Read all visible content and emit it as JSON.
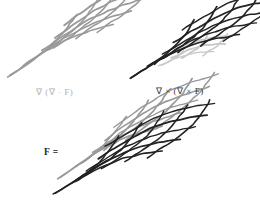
{
  "figure": {
    "background_color": "#ffffff",
    "width": 260,
    "height": 204,
    "colors": {
      "gray_mesh": "#999999",
      "dark_mesh": "#222222",
      "faint_mesh": "#c8c8c8",
      "label_gray": "#b3b3b3",
      "label_dark": "#3a3a3a",
      "label_black": "#1e1e1e"
    },
    "panels": [
      {
        "id": "grad-div",
        "label": "∇ (∇ · F)",
        "label_color": "#b3b3b3",
        "position": "top-left",
        "meshes": [
          "gray"
        ],
        "bounds": {
          "x": 15,
          "y": 12,
          "width": 112,
          "height": 68
        }
      },
      {
        "id": "curl-curl",
        "label": "∇ × (∇ × F)",
        "label_color": "#3a3a3a",
        "position": "top-right",
        "meshes": [
          "faint",
          "dark"
        ],
        "bounds": {
          "x": 134,
          "y": 24,
          "width": 122,
          "height": 62
        }
      },
      {
        "id": "f-total",
        "label": "F =",
        "label_color": "#1e1e1e",
        "position": "bottom-center",
        "meshes": [
          "gray",
          "dark"
        ],
        "bounds": {
          "x": 62,
          "y": 114,
          "width": 134,
          "height": 88
        }
      }
    ]
  },
  "chart_data": {
    "type": "diagram",
    "grid": true,
    "legend_position": "none",
    "xlabel": "",
    "ylabel": "",
    "annotations": [
      {
        "text": "∇ (∇ · F)",
        "x": 36,
        "y": 92,
        "color": "#b3b3b3"
      },
      {
        "text": "∇ × (∇ × F)",
        "x": 156,
        "y": 92,
        "color": "#3a3a3a"
      },
      {
        "text": "F =",
        "x": 44,
        "y": 153,
        "color": "#1e1e1e"
      }
    ],
    "series": [
      {
        "name": "grad-div-mesh",
        "color": "#999999",
        "panel": "top-left",
        "u_lines": 5,
        "v_lines": 5,
        "origin_x": 18,
        "origin_y": 70,
        "u_step_x": 22,
        "u_step_y": -11,
        "v_step_x": 14,
        "v_step_y": -13,
        "bow": 7
      },
      {
        "name": "curl-curl-faint-mesh",
        "color": "#c8c8c8",
        "panel": "top-right",
        "u_lines": 3,
        "v_lines": 3,
        "origin_x": 168,
        "origin_y": 62,
        "u_step_x": 20,
        "u_step_y": -5,
        "v_step_x": 9,
        "v_step_y": -8,
        "bow": 3
      },
      {
        "name": "curl-curl-dark-mesh",
        "color": "#222222",
        "panel": "top-right",
        "u_lines": 5,
        "v_lines": 5,
        "origin_x": 140,
        "origin_y": 72,
        "u_step_x": 23,
        "u_step_y": -9,
        "v_step_x": 13,
        "v_step_y": -12,
        "bow": 8
      },
      {
        "name": "f-total-gray-mesh",
        "color": "#999999",
        "panel": "bottom-center",
        "u_lines": 5,
        "v_lines": 5,
        "origin_x": 68,
        "origin_y": 172,
        "u_step_x": 22,
        "u_step_y": -11,
        "v_step_x": 14,
        "v_step_y": -13,
        "bow": 7
      },
      {
        "name": "f-total-dark-mesh",
        "color": "#222222",
        "panel": "bottom-center",
        "u_lines": 5,
        "v_lines": 5,
        "origin_x": 64,
        "origin_y": 188,
        "u_step_x": 23,
        "u_step_y": -9,
        "v_step_x": 13,
        "v_step_y": -12,
        "bow": 8
      }
    ]
  }
}
